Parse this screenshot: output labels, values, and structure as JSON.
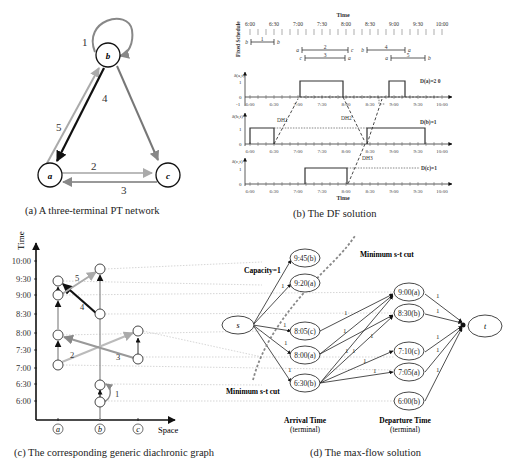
{
  "panel_a": {
    "caption": "(a)  A three-terminal PT network",
    "nodes": [
      {
        "id": "b",
        "label": "b"
      },
      {
        "id": "a",
        "label": "a"
      },
      {
        "id": "c",
        "label": "c"
      }
    ],
    "edges": [
      {
        "label": "1",
        "from": "b",
        "to": "b",
        "color": "#888888"
      },
      {
        "label": "2",
        "from": "a",
        "to": "c",
        "color": "#b5b5b5"
      },
      {
        "label": "3",
        "from": "c",
        "to": "a",
        "color": "#999999"
      },
      {
        "label": "4",
        "from": "b",
        "to": "a",
        "color": "#111111"
      },
      {
        "label": "5",
        "from": "a",
        "to": "b",
        "color": "#aaaaaa"
      }
    ],
    "extra_edge_bc": {
      "from": "b",
      "to": "c",
      "color": "#777777"
    }
  },
  "panel_b": {
    "caption": "(b) The DF solution",
    "time_label": "Time",
    "fixed_schedule_label": "Fixed Schedule",
    "time_ticks": [
      "6:00",
      "6:30",
      "7:00",
      "7:30",
      "8:00",
      "8:30",
      "9:00",
      "9:30",
      "10:00"
    ],
    "trips": [
      {
        "id": "1",
        "from": "b",
        "to": "b",
        "start": "6:00",
        "end": "6:30"
      },
      {
        "id": "2",
        "from": "a",
        "to": "c",
        "start": "7:00",
        "end": "8:00"
      },
      {
        "id": "3",
        "from": "c",
        "to": "a",
        "start": "7:05",
        "end": "7:55"
      },
      {
        "id": "4",
        "from": "b",
        "to": "a",
        "start": "8:30",
        "end": "9:20"
      },
      {
        "id": "5",
        "from": "a",
        "to": "b",
        "start": "9:00",
        "end": "9:45"
      }
    ],
    "plots": [
      {
        "ylabel": "δ(a,t)",
        "yticks": [
          "1",
          "0",
          "-1"
        ],
        "D_label": "D(a)=2 0"
      },
      {
        "ylabel": "δ(b,t)",
        "yticks": [
          "1",
          "0"
        ],
        "D_label": "D(b)=1"
      },
      {
        "ylabel": "δ(c,t)",
        "yticks": [
          "1",
          "0"
        ],
        "D_label": "D(c)=1"
      }
    ],
    "dh_labels": [
      "DH1",
      "DH2",
      "DH3"
    ]
  },
  "panel_c": {
    "caption": "(c)  The corresponding generic diachronic graph",
    "y_axis_label": "Time",
    "x_axis_label": "Space",
    "y_ticks": [
      "10:00",
      "9:30",
      "9:00",
      "8:30",
      "8:00",
      "7:30",
      "7:00",
      "6:30",
      "6:00"
    ],
    "x_ticks": [
      "a",
      "b",
      "c"
    ],
    "edge_labels": [
      "1",
      "2",
      "3",
      "4",
      "5"
    ]
  },
  "panel_d": {
    "caption": "(d) The max-flow solution",
    "source": "s",
    "sink": "t",
    "capacity_label": "Capacity=1",
    "cut_label_top": "Minimum s-t cut",
    "cut_label_bottom": "Minimum s-t cut",
    "arrival_nodes": [
      "9:45(b)",
      "9:20(a)",
      "8:05(c)",
      "8:00(a)",
      "6:30(b)"
    ],
    "departure_nodes": [
      "9:00(a)",
      "8:30(b)",
      "7:10(c)",
      "7:05(a)",
      "6:00(b)"
    ],
    "arrival_header": "Arrival Time",
    "arrival_sub": "(terminal)",
    "departure_header": "Departure Time",
    "departure_sub": "(terminal)",
    "edge_capacity": "1"
  }
}
